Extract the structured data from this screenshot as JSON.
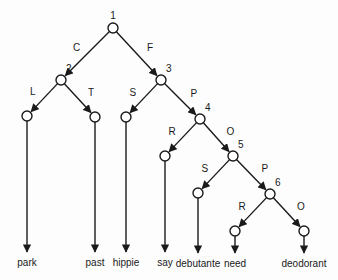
{
  "diagram": {
    "type": "decision-tree",
    "nodes": [
      {
        "id": "1",
        "label": "1",
        "x": 113,
        "y": 28
      },
      {
        "id": "2",
        "label": "2",
        "x": 61,
        "y": 80
      },
      {
        "id": "3",
        "label": "3",
        "x": 161,
        "y": 80
      },
      {
        "id": "4",
        "label": "4",
        "x": 200,
        "y": 119
      },
      {
        "id": "5",
        "label": "5",
        "x": 233,
        "y": 156
      },
      {
        "id": "6",
        "label": "6",
        "x": 270,
        "y": 194
      },
      {
        "id": "l_park",
        "label": "",
        "x": 27,
        "y": 116
      },
      {
        "id": "l_past",
        "label": "",
        "x": 95,
        "y": 117
      },
      {
        "id": "l_hippie",
        "label": "",
        "x": 126,
        "y": 117
      },
      {
        "id": "l_say",
        "label": "",
        "x": 165,
        "y": 156
      },
      {
        "id": "l_debutante",
        "label": "",
        "x": 198,
        "y": 193
      },
      {
        "id": "l_need",
        "label": "",
        "x": 235,
        "y": 231
      },
      {
        "id": "l_deodorant",
        "label": "",
        "x": 304,
        "y": 231
      }
    ],
    "edges": [
      {
        "from": "1",
        "to": "2",
        "label": "C"
      },
      {
        "from": "1",
        "to": "3",
        "label": "F"
      },
      {
        "from": "2",
        "to": "l_park",
        "label": "L"
      },
      {
        "from": "2",
        "to": "l_past",
        "label": "T"
      },
      {
        "from": "3",
        "to": "l_hippie",
        "label": "S"
      },
      {
        "from": "3",
        "to": "4",
        "label": "P"
      },
      {
        "from": "4",
        "to": "l_say",
        "label": "R"
      },
      {
        "from": "4",
        "to": "5",
        "label": "O"
      },
      {
        "from": "5",
        "to": "l_debutante",
        "label": "S"
      },
      {
        "from": "5",
        "to": "6",
        "label": "P"
      },
      {
        "from": "6",
        "to": "l_need",
        "label": "R"
      },
      {
        "from": "6",
        "to": "l_deodorant",
        "label": "O"
      }
    ],
    "leaves": [
      {
        "node": "l_park",
        "word": "park",
        "arrow_end_y": 253
      },
      {
        "node": "l_past",
        "word": "past",
        "arrow_end_y": 253
      },
      {
        "node": "l_hippie",
        "word": "hippie",
        "arrow_end_y": 253
      },
      {
        "node": "l_say",
        "word": "say",
        "arrow_end_y": 253
      },
      {
        "node": "l_debutante",
        "word": "debutante",
        "arrow_end_y": 254
      },
      {
        "node": "l_need",
        "word": "need",
        "arrow_end_y": 254
      },
      {
        "node": "l_deodorant",
        "word": "deodorant",
        "arrow_end_y": 254
      }
    ]
  }
}
